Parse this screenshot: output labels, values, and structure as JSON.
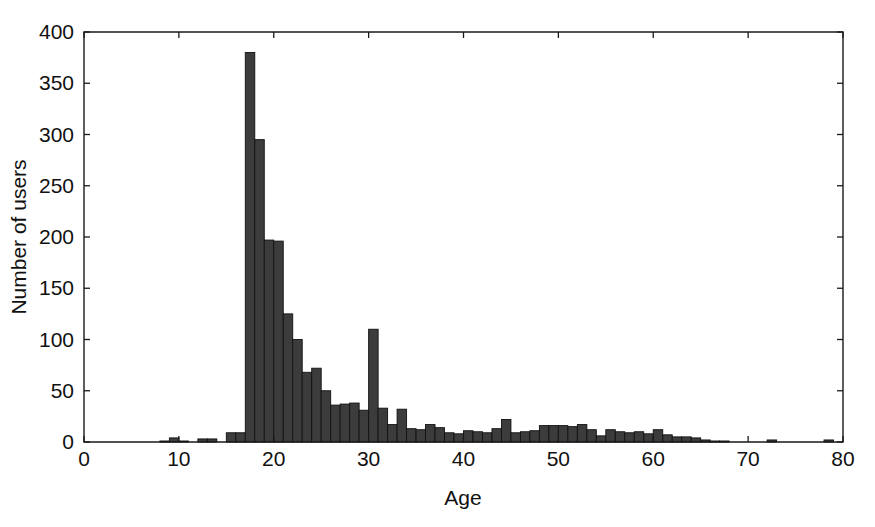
{
  "figure": {
    "background_color": "#ffffff",
    "axis_color": "#1a1a1a",
    "bar_fill_color": "#3c3c3c",
    "bar_edge_color": "#111111"
  },
  "chart_data": {
    "type": "bar",
    "title": "",
    "subtitle": "",
    "xlabel": "Age",
    "ylabel": "Number of users",
    "xlim": [
      0,
      80
    ],
    "ylim": [
      0,
      400
    ],
    "xticks": [
      0,
      10,
      20,
      30,
      40,
      50,
      60,
      70,
      80
    ],
    "xtick_labels": [
      "0",
      "10",
      "20",
      "30",
      "40",
      "50",
      "60",
      "70",
      "80"
    ],
    "yticks": [
      0,
      50,
      100,
      150,
      200,
      250,
      300,
      350,
      400
    ],
    "ytick_labels": [
      "0",
      "50",
      "100",
      "150",
      "200",
      "250",
      "300",
      "350",
      "400"
    ],
    "grid": false,
    "legend": null,
    "bin_width": 1,
    "categories": [
      7,
      8,
      9,
      10,
      11,
      12,
      13,
      14,
      15,
      16,
      17,
      18,
      19,
      20,
      21,
      22,
      23,
      24,
      25,
      26,
      27,
      28,
      29,
      30,
      31,
      32,
      33,
      34,
      35,
      36,
      37,
      38,
      39,
      40,
      41,
      42,
      43,
      44,
      45,
      46,
      47,
      48,
      49,
      50,
      51,
      52,
      53,
      54,
      55,
      56,
      57,
      58,
      59,
      60,
      61,
      62,
      63,
      64,
      65,
      66,
      67,
      68,
      69,
      70,
      71,
      72,
      73,
      74,
      75,
      76,
      77,
      78,
      79
    ],
    "values": [
      0,
      1,
      4,
      1,
      0,
      3,
      3,
      0,
      9,
      9,
      380,
      295,
      197,
      196,
      125,
      100,
      68,
      72,
      50,
      36,
      37,
      38,
      31,
      110,
      33,
      17,
      32,
      13,
      12,
      17,
      14,
      9,
      8,
      11,
      10,
      9,
      13,
      22,
      9,
      10,
      11,
      16,
      16,
      16,
      15,
      17,
      12,
      6,
      12,
      10,
      9,
      10,
      8,
      12,
      7,
      5,
      5,
      4,
      2,
      1,
      1,
      0,
      0,
      0,
      0,
      2,
      0,
      0,
      0,
      0,
      0,
      2,
      0
    ]
  },
  "axis_titles": {
    "x": "Age",
    "y": "Number of users"
  }
}
